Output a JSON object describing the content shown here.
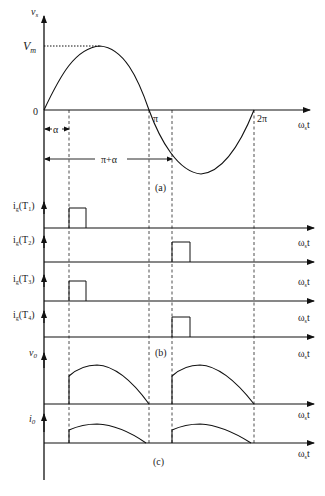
{
  "figure": {
    "panel_a": {
      "y_label": "v",
      "y_label_sub": "s",
      "vm_label": "V",
      "vm_sub": "m",
      "origin_label": "0",
      "pi_label": "π",
      "two_pi_label": "2π",
      "x_label": "ω",
      "x_label_sub": "s",
      "x_label_t": "t",
      "alpha_label": "α",
      "pi_alpha_label": "π+α",
      "caption": "(a)"
    },
    "panel_b": {
      "gates": [
        {
          "label": "i",
          "sub": "g",
          "tail": "(T",
          "num": "1",
          "close": ")"
        },
        {
          "label": "i",
          "sub": "g",
          "tail": "(T",
          "num": "2",
          "close": ")"
        },
        {
          "label": "i",
          "sub": "g",
          "tail": "(T",
          "num": "3",
          "close": ")"
        },
        {
          "label": "i",
          "sub": "g",
          "tail": "(T",
          "num": "4",
          "close": ")"
        }
      ],
      "x_label": "ω",
      "x_label_sub": "s",
      "x_label_t": "t",
      "caption": "(b)"
    },
    "panel_c": {
      "v0_label": "v",
      "v0_sub": "0",
      "i0_label": "i",
      "i0_sub": "0",
      "x_label": "ω",
      "x_label_sub": "s",
      "x_label_t": "t",
      "caption": "(c)"
    }
  }
}
